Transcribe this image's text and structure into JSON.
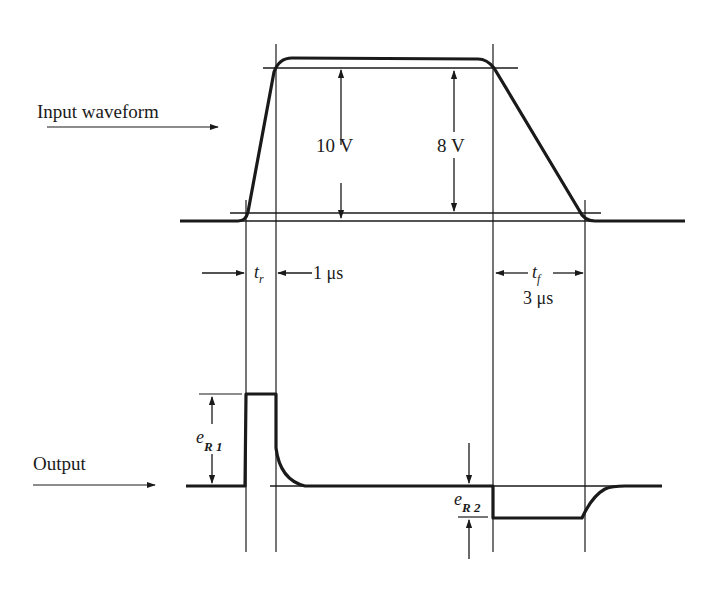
{
  "colors": {
    "ink": "#1a1a1a",
    "background": "#ffffff"
  },
  "input": {
    "label": "Input waveform",
    "amplitude_label": "10 V",
    "reference_amplitude_label": "8 V",
    "rise_time": {
      "symbol": "t",
      "subscript": "r",
      "value": "1 μs"
    },
    "fall_time": {
      "symbol": "t",
      "subscript": "f",
      "value": "3 μs"
    }
  },
  "output": {
    "label": "Output",
    "positive_spike": {
      "symbol": "e",
      "subscript": "R 1"
    },
    "negative_spike": {
      "symbol": "e",
      "subscript": "R 2"
    }
  }
}
